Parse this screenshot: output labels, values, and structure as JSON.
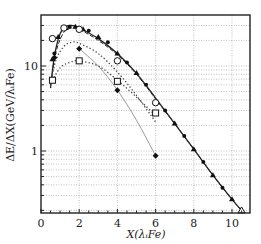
{
  "chart_data": {
    "type": "line",
    "title": "",
    "xlabel": "X(λᵢFe)",
    "ylabel": "ΔE/ΔX(GeV/λᵢFe)",
    "xlim": [
      0,
      10.9
    ],
    "ylim": [
      0.187,
      39.8
    ],
    "yscale": "log",
    "grid": true,
    "x_ticks": [
      0,
      2,
      4,
      6,
      8,
      10
    ],
    "x_tick_labels": [
      "0",
      "2",
      "4",
      "6",
      "8",
      "10"
    ],
    "y_ticks": [
      1,
      10
    ],
    "y_tick_labels": [
      "1",
      "10"
    ],
    "legend": null,
    "series": [
      {
        "name": "solid curve (main fit)",
        "style": "solid",
        "marker": "none",
        "x": [
          0.5,
          0.7,
          1.0,
          1.3,
          1.6,
          2.0,
          3.0,
          4.0,
          5.0,
          6.0,
          7.0,
          8.0,
          9.0,
          10.0,
          10.5
        ],
        "y": [
          5.5,
          13,
          24,
          29,
          30,
          28,
          21,
          14,
          8.2,
          4.2,
          2.1,
          1.05,
          0.52,
          0.27,
          0.2
        ]
      },
      {
        "name": "dashed curve",
        "style": "dashed",
        "marker": "none",
        "x": [
          0.5,
          0.8,
          1.2,
          1.6,
          2.0,
          3.0,
          4.0,
          5.0,
          6.0,
          7.0,
          8.0,
          9.0,
          10.0,
          10.5
        ],
        "y": [
          6,
          15,
          25,
          28,
          27,
          20,
          13.5,
          8,
          4.1,
          2.1,
          1.05,
          0.52,
          0.27,
          0.2
        ]
      },
      {
        "name": "dotted curve (upper)",
        "style": "dotted",
        "marker": "none",
        "x": [
          0.5,
          0.8,
          1.2,
          1.6,
          2.0,
          3.0,
          4.0,
          5.0,
          6.0
        ],
        "y": [
          6.5,
          12,
          17,
          19,
          18.5,
          14,
          8.5,
          4.5,
          2.2
        ]
      },
      {
        "name": "dotted curve (lower)",
        "style": "dotted",
        "marker": "none",
        "x": [
          0.5,
          1.0,
          1.5,
          2.0,
          3.0,
          4.0,
          5.0,
          6.0
        ],
        "y": [
          6.2,
          9.5,
          11,
          11.5,
          10,
          6.8,
          4.3,
          2.6
        ]
      },
      {
        "name": "thin line (diamond)",
        "style": "solid-thin",
        "marker": "none",
        "x": [
          2.0,
          3.0,
          4.0,
          5.0,
          6.0
        ],
        "y": [
          16,
          10,
          5.2,
          2.3,
          0.88
        ]
      },
      {
        "name": "filled triangles",
        "marker": "filled-triangle",
        "x": [
          0.6,
          0.9,
          1.3,
          1.8,
          2.2,
          3.0,
          4.0,
          5.0,
          7.0,
          8.0,
          9.0,
          10.0
        ],
        "y": [
          12,
          22,
          28,
          29,
          27,
          22,
          14,
          8.3,
          2.1,
          1.05,
          0.52,
          0.27
        ]
      },
      {
        "name": "filled circles",
        "marker": "filled-circle",
        "x": [
          0.7,
          1.5,
          2.5,
          3.5,
          4.5,
          5.5,
          6.5,
          7.5,
          8.5,
          9.5
        ],
        "y": [
          14,
          29,
          26,
          19,
          11,
          6,
          3,
          1.5,
          0.74,
          0.37
        ]
      },
      {
        "name": "open circles",
        "marker": "open-circle",
        "x": [
          0.6,
          1.2,
          2.0,
          4.0,
          6.0
        ],
        "y": [
          21,
          28,
          27,
          11.5,
          3.7
        ]
      },
      {
        "name": "open squares",
        "marker": "open-square",
        "x": [
          0.6,
          2.0,
          4.0,
          6.0
        ],
        "y": [
          6.8,
          11.5,
          6.6,
          2.8
        ]
      },
      {
        "name": "open triangles",
        "marker": "open-triangle",
        "x": [
          10.5
        ],
        "y": [
          0.2
        ]
      },
      {
        "name": "filled diamonds",
        "marker": "filled-diamond",
        "x": [
          0.7,
          2.0,
          4.0,
          6.0
        ],
        "y": [
          12.5,
          16,
          5.2,
          0.88
        ]
      }
    ]
  },
  "axes": {
    "xlabel": "X(λᵢFe)",
    "ylabel": "ΔE/ΔX(GeV/λᵢFe)"
  }
}
